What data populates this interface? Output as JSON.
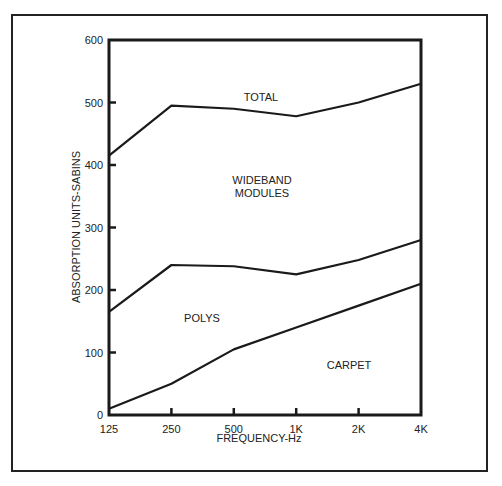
{
  "chart_data": {
    "type": "area",
    "title": "",
    "xlabel": "FREQUENCY-Hz",
    "ylabel": "ABSORPTION UNITS-SABINS",
    "categories": [
      "125",
      "250",
      "500",
      "1K",
      "2K",
      "4K"
    ],
    "ylim": [
      0,
      600
    ],
    "yticks": [
      0,
      100,
      200,
      300,
      400,
      500,
      600
    ],
    "grid": false,
    "legend": "none (inline region labels)",
    "stacked": true,
    "series": [
      {
        "name": "CARPET",
        "cumulative_values": [
          10,
          50,
          105,
          140,
          175,
          210
        ]
      },
      {
        "name": "POLYS",
        "cumulative_values": [
          165,
          240,
          238,
          225,
          248,
          280
        ]
      },
      {
        "name": "WIDEBAND MODULES / TOTAL",
        "cumulative_values": [
          415,
          495,
          490,
          478,
          500,
          530
        ]
      }
    ],
    "region_labels": [
      "TOTAL",
      "WIDEBAND",
      "MODULES",
      "POLYS",
      "CARPET"
    ]
  },
  "axis": {
    "y_tick_labels": [
      "0",
      "100",
      "200",
      "300",
      "400",
      "500",
      "600"
    ],
    "x_tick_labels": [
      "125",
      "250",
      "500",
      "1K",
      "2K",
      "4K"
    ],
    "x_title": "FREQUENCY-Hz",
    "y_title": "ABSORPTION UNITS-SABINS"
  },
  "labels": {
    "total": "TOTAL",
    "wideband_line1": "WIDEBAND",
    "wideband_line2": "MODULES",
    "polys": "POLYS",
    "carpet": "CARPET"
  }
}
